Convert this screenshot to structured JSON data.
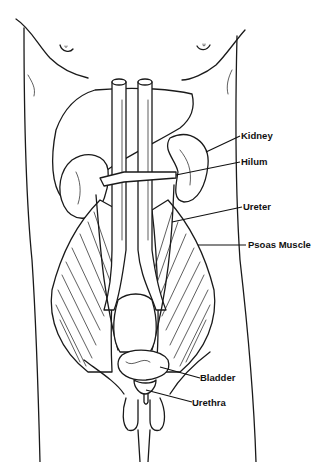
{
  "diagram": {
    "labels": {
      "kidney": "Kidney",
      "hilum": "Hilum",
      "ureter": "Ureter",
      "psoas_muscle": "Psoas Muscle",
      "bladder": "Bladder",
      "urethra": "Urethra"
    },
    "colors": {
      "line": "#1a1a1a",
      "background": "#ffffff"
    }
  }
}
